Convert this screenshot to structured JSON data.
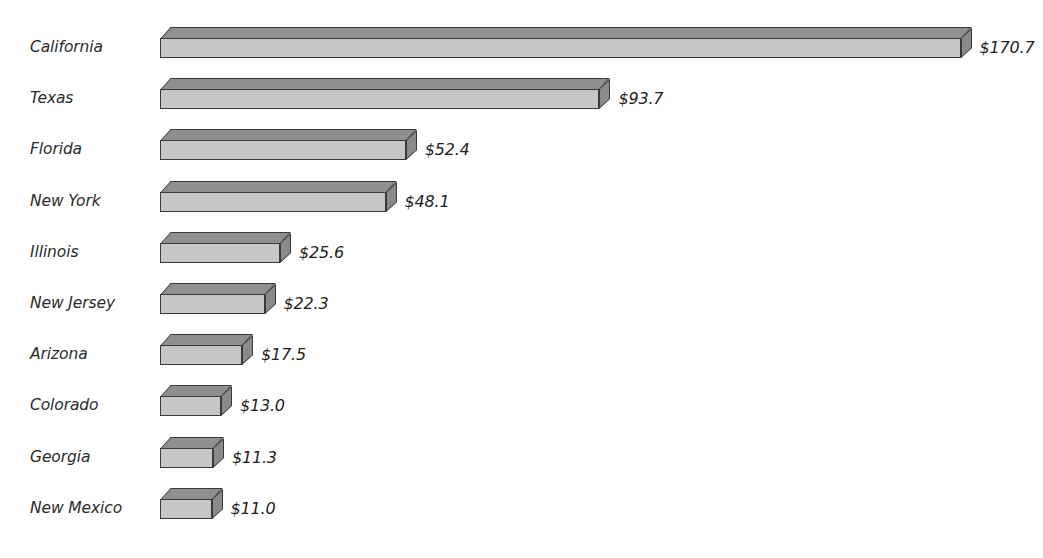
{
  "chart_data": {
    "type": "bar",
    "orientation": "horizontal",
    "title": "",
    "subtitle": "",
    "xlabel": "",
    "ylabel": "",
    "grid": false,
    "legend": null,
    "legend_position": "none",
    "value_prefix": "$",
    "xlim": [
      0,
      170.7
    ],
    "categories": [
      "California",
      "Texas",
      "Florida",
      "New York",
      "Illinois",
      "New Jersey",
      "Arizona",
      "Colorado",
      "Georgia",
      "New Mexico"
    ],
    "values": [
      170.7,
      93.7,
      52.4,
      48.1,
      25.6,
      22.3,
      17.5,
      13.0,
      11.3,
      11.0
    ],
    "data_labels": [
      "$170.7",
      "$93.7",
      "$52.4",
      "$48.1",
      "$25.6",
      "$22.3",
      "$17.5",
      "$13.0",
      "$11.3",
      "$11.0"
    ],
    "points": [
      {
        "category": "California",
        "value": 170.7,
        "label": "$170.7"
      },
      {
        "category": "Texas",
        "value": 93.7,
        "label": "$93.7"
      },
      {
        "category": "Florida",
        "value": 52.4,
        "label": "$52.4"
      },
      {
        "category": "New York",
        "value": 48.1,
        "label": "$48.1"
      },
      {
        "category": "Illinois",
        "value": 25.6,
        "label": "$25.6"
      },
      {
        "category": "New Jersey",
        "value": 22.3,
        "label": "$22.3"
      },
      {
        "category": "Arizona",
        "value": 17.5,
        "label": "$17.5"
      },
      {
        "category": "Colorado",
        "value": 13.0,
        "label": "$13.0"
      },
      {
        "category": "Georgia",
        "value": 11.3,
        "label": "$11.3"
      },
      {
        "category": "New Mexico",
        "value": 11.0,
        "label": "$11.0"
      }
    ]
  },
  "style": {
    "background": "#ffffff",
    "bar_front_color": "#c6c6c6",
    "bar_top_color": "#8f8f8f",
    "bar_end_color": "#8a8a8a",
    "bar_outline_color": "#3a3a3a",
    "label_color": "#2b2b2b",
    "value_color": "#1e1e1e"
  },
  "layout": {
    "bar_origin_x": 160,
    "px_per_unit": 4.69,
    "row_height": 51.2,
    "first_row_top": 27,
    "bar_depth": 11
  }
}
